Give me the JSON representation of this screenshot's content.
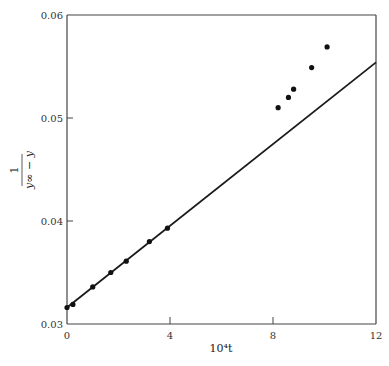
{
  "chart_data": {
    "type": "scatter",
    "title": "",
    "xlabel": "10^4 t",
    "xlabel_display": "10⁴t",
    "ylabel": "1 / (y∞ − y)",
    "ylabel_numerator": "1",
    "ylabel_denominator": "y∞ − y",
    "xlim": [
      0,
      12
    ],
    "ylim": [
      0.03,
      0.06
    ],
    "x_ticks": [
      0,
      4,
      8,
      12
    ],
    "x_tick_labels": [
      "0",
      "4",
      "8",
      "12"
    ],
    "y_ticks": [
      0.03,
      0.04,
      0.05,
      0.06
    ],
    "y_tick_labels": [
      "0.03",
      "0.04",
      "0.05",
      "0.06"
    ],
    "grid": false,
    "legend": null,
    "series": [
      {
        "name": "measured points",
        "kind": "scatter",
        "x": [
          0.0,
          0.23,
          1.0,
          1.7,
          2.3,
          3.2,
          3.9,
          8.2,
          8.6,
          8.8,
          9.5,
          10.1
        ],
        "y": [
          0.0316,
          0.0319,
          0.0336,
          0.035,
          0.0361,
          0.038,
          0.0393,
          0.051,
          0.052,
          0.0528,
          0.0549,
          0.0569
        ]
      },
      {
        "name": "fitted line",
        "kind": "line",
        "x": [
          0,
          12
        ],
        "y": [
          0.0316,
          0.0554
        ]
      }
    ]
  }
}
